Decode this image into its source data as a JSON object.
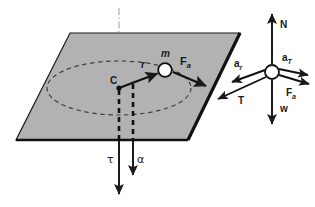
{
  "figure": {
    "canvas": {
      "width": 315,
      "height": 207,
      "background": "#ffffff"
    },
    "colors": {
      "plane_fill": "#b2b2b2",
      "plane_edge": "#1a1a1a",
      "vector": "#1a1a1a",
      "dashed_path": "#3a3a3a",
      "axis_line": "#c8c8c8",
      "mass_fill": "#ffffff",
      "text": "#1a1a1a"
    }
  },
  "plane": {
    "name": "rotating-horizontal-plane",
    "points": "70,33 240,33 188,140 16,140",
    "fill": "#b2b2b2"
  },
  "rotation_axis": {
    "name": "rotation-axis",
    "style": "dash-dot",
    "x": 119,
    "y_top": 8,
    "y_bottom": 196
  },
  "circular_path": {
    "name": "circular-path-ellipse",
    "cx": 119,
    "cy": 88,
    "rx": 72,
    "ry": 27,
    "style": "dashed"
  },
  "center_point": {
    "label": "C",
    "x": 119,
    "y": 88
  },
  "mass": {
    "label": "m",
    "cx": 165,
    "cy": 70,
    "r": 6.5
  },
  "radius_vector": {
    "label": "r",
    "from": [
      119,
      88
    ],
    "to": [
      159,
      73
    ]
  },
  "plane_vectors": [
    {
      "name": "applied-force",
      "label": "F",
      "sub": "a",
      "from": [
        172,
        71
      ],
      "to": [
        208,
        86
      ]
    }
  ],
  "bottom_vectors": [
    {
      "name": "torque",
      "label": "τ",
      "x": 119,
      "y_from": 140,
      "y_to": 196,
      "label_x": 112,
      "label_y": 160
    },
    {
      "name": "angular-acceleration",
      "label": "α",
      "x": 133,
      "y_from": 140,
      "y_to": 176,
      "label_x": 139,
      "label_y": 160
    }
  ],
  "dashed_drops": [
    {
      "name": "center-drop-line",
      "x": 119,
      "y_from": 90,
      "y_to": 140
    },
    {
      "name": "mass-drop-line",
      "x": 133,
      "y_from": 84,
      "y_to": 140
    }
  ],
  "free_body": {
    "name": "free-body-diagram",
    "particle": {
      "cx": 272,
      "cy": 72,
      "r": 7
    },
    "vectors": [
      {
        "name": "normal-force",
        "label": "N",
        "from": [
          272,
          63
        ],
        "to": [
          272,
          14
        ],
        "label_x": 281,
        "label_y": 29
      },
      {
        "name": "weight",
        "label": "w",
        "from": [
          272,
          81
        ],
        "to": [
          272,
          125
        ],
        "label_x": 281,
        "label_y": 112
      },
      {
        "name": "tangential-acceleration",
        "label": "a",
        "sub": "T",
        "from": [
          279,
          70
        ],
        "to": [
          310,
          76
        ],
        "label_x": 283,
        "label_y": 60
      },
      {
        "name": "applied-force-fbd",
        "label": "F",
        "sub": "a",
        "from": [
          279,
          75
        ],
        "to": [
          311,
          84
        ],
        "label_x": 287,
        "label_y": 95
      },
      {
        "name": "radial-acceleration",
        "label": "a",
        "sub": "r",
        "from": [
          265,
          70
        ],
        "to": [
          230,
          83
        ],
        "label_x": 236,
        "label_y": 66
      },
      {
        "name": "tension",
        "label": "T",
        "from": [
          265,
          76
        ],
        "to": [
          216,
          100
        ],
        "label_x": 240,
        "label_y": 102
      }
    ]
  }
}
